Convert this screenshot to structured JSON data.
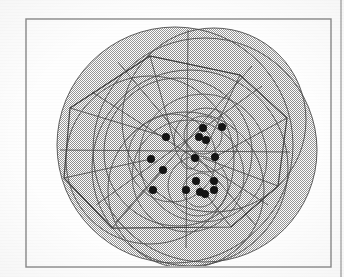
{
  "figure": {
    "title": "",
    "caption": "",
    "kind": "geometric-clustering-diagram",
    "background_color": "#fefefe",
    "ink_color": "#4a4a4a",
    "dark_ink_color": "#3a3a3a",
    "point_color": "#141414",
    "fill_color": "#b9b9b9",
    "frame_color": "#8a8a8a"
  },
  "frame": {
    "x": 26,
    "y": 19,
    "width": 305,
    "height": 248,
    "stroke_width": 1.4,
    "label": "figure-border"
  },
  "page_rule": {
    "x": 341,
    "y1": 0,
    "y2": 277,
    "stroke_width": 1.2,
    "label": "page-edge-rule"
  },
  "chart_data": {
    "type": "scatter",
    "title": "",
    "xlabel": "",
    "ylabel": "",
    "xlim": [
      26,
      331
    ],
    "ylim": [
      19,
      267
    ],
    "grid": false,
    "legend": "none",
    "point_radius": 4.0,
    "points": [
      {
        "id": "p1",
        "x": 203,
        "y": 128
      },
      {
        "id": "p2",
        "x": 222,
        "y": 127
      },
      {
        "id": "p3",
        "x": 199,
        "y": 137
      },
      {
        "id": "p4",
        "x": 206,
        "y": 140
      },
      {
        "id": "p5",
        "x": 166,
        "y": 137
      },
      {
        "id": "p6",
        "x": 151,
        "y": 159
      },
      {
        "id": "p7",
        "x": 195,
        "y": 158
      },
      {
        "id": "p8",
        "x": 215,
        "y": 157
      },
      {
        "id": "p9",
        "x": 163,
        "y": 170
      },
      {
        "id": "p10",
        "x": 153,
        "y": 190
      },
      {
        "id": "p11",
        "x": 196,
        "y": 181
      },
      {
        "id": "p12",
        "x": 214,
        "y": 181
      },
      {
        "id": "p13",
        "x": 186,
        "y": 190
      },
      {
        "id": "p14",
        "x": 200,
        "y": 192
      },
      {
        "id": "p15",
        "x": 205,
        "y": 194
      },
      {
        "id": "p16",
        "x": 214,
        "y": 190
      }
    ],
    "circles": [
      {
        "id": "c1",
        "cx": 175,
        "cy": 145,
        "r": 118,
        "filled": true
      },
      {
        "id": "c2",
        "cx": 205,
        "cy": 150,
        "r": 112,
        "filled": true
      },
      {
        "id": "c3",
        "cx": 190,
        "cy": 168,
        "r": 98,
        "filled": true
      },
      {
        "id": "c4",
        "cx": 150,
        "cy": 160,
        "r": 84,
        "filled": true
      },
      {
        "id": "c5",
        "cx": 214,
        "cy": 120,
        "r": 92,
        "filled": true
      },
      {
        "id": "c6",
        "cx": 186,
        "cy": 190,
        "r": 78,
        "filled": true
      },
      {
        "id": "c7",
        "cx": 178,
        "cy": 152,
        "r": 74,
        "filled": false
      },
      {
        "id": "c8",
        "cx": 203,
        "cy": 158,
        "r": 64,
        "filled": false
      },
      {
        "id": "c9",
        "cx": 188,
        "cy": 176,
        "r": 56,
        "filled": false
      },
      {
        "id": "c10",
        "cx": 172,
        "cy": 158,
        "r": 44,
        "filled": false
      },
      {
        "id": "c11",
        "cx": 206,
        "cy": 140,
        "r": 32,
        "filled": false
      },
      {
        "id": "c12",
        "cx": 198,
        "cy": 186,
        "r": 30,
        "filled": false
      },
      {
        "id": "c13",
        "cx": 203,
        "cy": 135,
        "r": 19,
        "filled": false
      },
      {
        "id": "c14",
        "cx": 200,
        "cy": 190,
        "r": 17,
        "filled": false
      },
      {
        "id": "c15",
        "cx": 190,
        "cy": 160,
        "r": 9,
        "filled": false
      }
    ],
    "polygon": {
      "id": "hull",
      "closed": true,
      "vertices": [
        [
          150,
          56
        ],
        [
          240,
          75
        ],
        [
          287,
          118
        ],
        [
          278,
          186
        ],
        [
          231,
          227
        ],
        [
          112,
          228
        ],
        [
          64,
          178
        ],
        [
          70,
          108
        ]
      ]
    },
    "segments": [
      [
        [
          150,
          56
        ],
        [
          175,
          145
        ]
      ],
      [
        [
          240,
          75
        ],
        [
          205,
          150
        ]
      ],
      [
        [
          287,
          118
        ],
        [
          215,
          157
        ]
      ],
      [
        [
          278,
          186
        ],
        [
          203,
          158
        ]
      ],
      [
        [
          231,
          227
        ],
        [
          196,
          181
        ]
      ],
      [
        [
          112,
          228
        ],
        [
          163,
          170
        ]
      ],
      [
        [
          64,
          178
        ],
        [
          151,
          159
        ]
      ],
      [
        [
          70,
          108
        ],
        [
          166,
          137
        ]
      ],
      [
        [
          70,
          108
        ],
        [
          150,
          56
        ]
      ],
      [
        [
          150,
          56
        ],
        [
          240,
          75
        ]
      ],
      [
        [
          64,
          178
        ],
        [
          112,
          228
        ]
      ],
      [
        [
          231,
          227
        ],
        [
          278,
          186
        ]
      ],
      [
        [
          92,
          92
        ],
        [
          268,
          205
        ]
      ],
      [
        [
          96,
          205
        ],
        [
          262,
          86
        ]
      ],
      [
        [
          60,
          150
        ],
        [
          290,
          152
        ]
      ],
      [
        [
          188,
          30
        ],
        [
          186,
          248
        ]
      ],
      [
        [
          118,
          62
        ],
        [
          256,
          226
        ]
      ],
      [
        [
          252,
          66
        ],
        [
          116,
          222
        ]
      ]
    ]
  },
  "annotations": {
    "point_count_label": "16",
    "circle_count_label": "15"
  }
}
